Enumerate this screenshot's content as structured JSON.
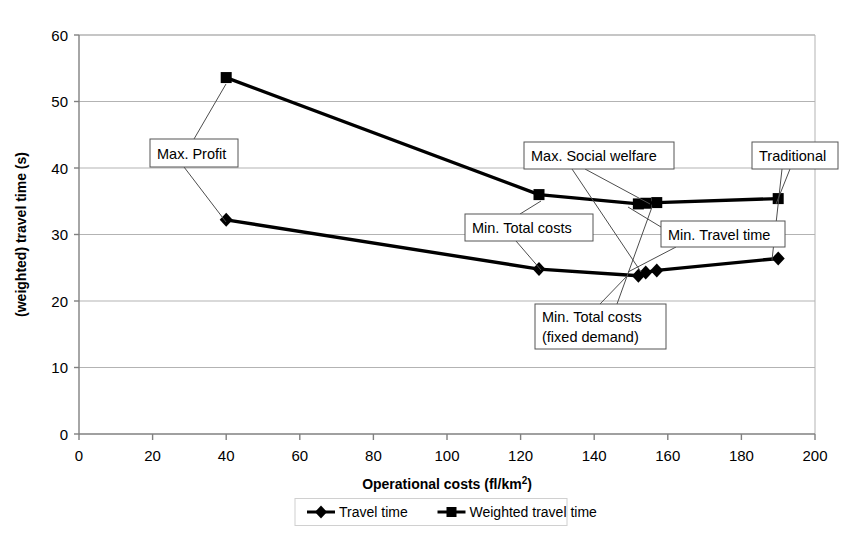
{
  "chart_data": {
    "type": "line",
    "title": "",
    "xlabel": "Operational costs (fl/km²)",
    "xlabel_base": "Operational costs (fl/km",
    "xlabel_sup": "2",
    "xlabel_close": ")",
    "ylabel": "(weighted) travel time (s)",
    "xlim": [
      0,
      200
    ],
    "ylim": [
      0,
      60
    ],
    "xticks": [
      0,
      20,
      40,
      60,
      80,
      100,
      120,
      140,
      160,
      180,
      200
    ],
    "yticks": [
      0,
      10,
      20,
      30,
      40,
      50,
      60
    ],
    "grid": "horizontal",
    "legend_position": "bottom",
    "series": [
      {
        "name": "Travel time",
        "marker": "diamond",
        "color": "#000000",
        "x": [
          40,
          125,
          152,
          154,
          157,
          190
        ],
        "y": [
          32.2,
          24.8,
          23.8,
          24.3,
          24.6,
          26.4
        ]
      },
      {
        "name": "Weighted travel time",
        "marker": "square",
        "color": "#000000",
        "x": [
          40,
          125,
          152,
          154,
          157,
          190
        ],
        "y": [
          53.6,
          36.0,
          34.6,
          34.7,
          34.8,
          35.4
        ]
      }
    ],
    "annotations": [
      {
        "id": "max-profit",
        "lines": [
          "Max. Profit"
        ],
        "box": {
          "x": 150,
          "y": 139,
          "w": 88,
          "h": 28
        },
        "leaders": [
          {
            "x1": 194,
            "y1": 139,
            "x2": 226,
            "y2": 84
          },
          {
            "x1": 184,
            "y1": 167,
            "x2": 226,
            "y2": 222
          }
        ]
      },
      {
        "id": "max-social-welfare",
        "lines": [
          "Max. Social welfare"
        ],
        "box": {
          "x": 524,
          "y": 142,
          "w": 150,
          "h": 27
        },
        "leaders": [
          {
            "x1": 585,
            "y1": 169,
            "x2": 650,
            "y2": 204
          },
          {
            "x1": 572,
            "y1": 169,
            "x2": 641,
            "y2": 272
          }
        ]
      },
      {
        "id": "min-total-costs",
        "lines": [
          "Min. Total costs"
        ],
        "box": {
          "x": 465,
          "y": 214,
          "w": 128,
          "h": 27
        },
        "leaders": [
          {
            "x1": 520,
            "y1": 214,
            "x2": 541,
            "y2": 201
          },
          {
            "x1": 516,
            "y1": 241,
            "x2": 541,
            "y2": 270
          }
        ]
      },
      {
        "id": "min-travel-time",
        "lines": [
          "Min. Travel time"
        ],
        "box": {
          "x": 661,
          "y": 221,
          "w": 124,
          "h": 26
        },
        "leaders": [
          {
            "x1": 661,
            "y1": 227,
            "x2": 628,
            "y2": 207
          },
          {
            "x1": 676,
            "y1": 247,
            "x2": 628,
            "y2": 272
          }
        ]
      },
      {
        "id": "min-total-costs-fixed-demand",
        "lines": [
          "Min. Total costs",
          "(fixed demand)"
        ],
        "box": {
          "x": 535,
          "y": 304,
          "w": 131,
          "h": 45
        },
        "leaders": [
          {
            "x1": 617,
            "y1": 304,
            "x2": 652,
            "y2": 207
          },
          {
            "x1": 600,
            "y1": 304,
            "x2": 628,
            "y2": 275
          }
        ]
      },
      {
        "id": "traditional",
        "lines": [
          "Traditional"
        ],
        "box": {
          "x": 752,
          "y": 142,
          "w": 86,
          "h": 27
        },
        "leaders": [
          {
            "x1": 790,
            "y1": 169,
            "x2": 776,
            "y2": 204
          },
          {
            "x1": 782,
            "y1": 169,
            "x2": 772,
            "y2": 260
          }
        ]
      }
    ]
  },
  "legend": {
    "items": [
      {
        "label": "Travel time",
        "marker": "diamond"
      },
      {
        "label": "Weighted travel time",
        "marker": "square"
      }
    ]
  }
}
